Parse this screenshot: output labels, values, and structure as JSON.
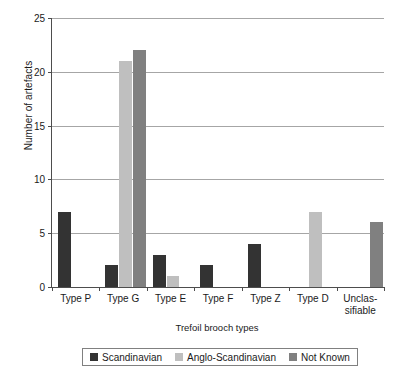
{
  "chart_data": {
    "type": "bar",
    "title": "",
    "xlabel": "Trefoil brooch types",
    "ylabel": "Number of artefacts",
    "categories": [
      "Type P",
      "Type G",
      "Type E",
      "Type F",
      "Type Z",
      "Type D",
      "Unclas-\nsifiable"
    ],
    "category_labels": [
      {
        "line1": "Type P",
        "line2": ""
      },
      {
        "line1": "Type G",
        "line2": ""
      },
      {
        "line1": "Type E",
        "line2": ""
      },
      {
        "line1": "Type F",
        "line2": ""
      },
      {
        "line1": "Type Z",
        "line2": ""
      },
      {
        "line1": "Type D",
        "line2": ""
      },
      {
        "line1": "Unclas-",
        "line2": "sifiable"
      }
    ],
    "series": [
      {
        "name": "Scandinavian",
        "color": "#333333",
        "values": [
          7,
          2,
          3,
          2,
          4,
          0,
          0
        ]
      },
      {
        "name": "Anglo-Scandinavian",
        "color": "#bfbfbf",
        "values": [
          0,
          21,
          1,
          0,
          0,
          7,
          0
        ]
      },
      {
        "name": "Not Known",
        "color": "#808080",
        "values": [
          0,
          22,
          0,
          0,
          0,
          0,
          6
        ]
      }
    ],
    "ylim": [
      0,
      25
    ],
    "yticks": [
      0,
      5,
      10,
      15,
      20,
      25
    ],
    "ytick_labels": [
      "0",
      "5",
      "10",
      "15",
      "20",
      "25"
    ],
    "grid": true,
    "legend_position": "bottom",
    "axis_color": "#4d4d4d",
    "grid_color": "#a6a6a6"
  }
}
